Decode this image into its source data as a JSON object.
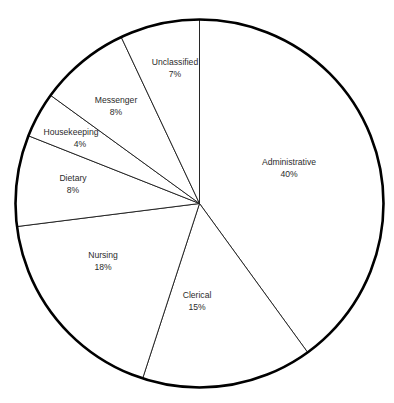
{
  "chart_data": {
    "type": "pie",
    "title": "",
    "subtitle": "",
    "xlabel": "",
    "ylabel": "",
    "legend": "none",
    "grid": false,
    "start_angle_deg_from_12oclock": 0,
    "direction": "clockwise",
    "total_percent": 100,
    "categories": [
      "Administrative",
      "Clerical",
      "Nursing",
      "Dietary",
      "Housekeeping",
      "Messenger",
      "Unclassified"
    ],
    "values": [
      40,
      15,
      18,
      8,
      4,
      8,
      7
    ],
    "value_suffix": "%",
    "slices": [
      {
        "label": "Administrative",
        "value": 40,
        "value_text": "40%",
        "start_deg": 0,
        "end_deg": 144,
        "label_x": 289,
        "label_y": 163,
        "value_x": 289,
        "value_y": 175
      },
      {
        "label": "Clerical",
        "value": 15,
        "value_text": "15%",
        "start_deg": 144,
        "end_deg": 198,
        "label_x": 197,
        "label_y": 296,
        "value_x": 197,
        "value_y": 308
      },
      {
        "label": "Nursing",
        "value": 18,
        "value_text": "18%",
        "start_deg": 198,
        "end_deg": 262.8,
        "label_x": 103,
        "label_y": 256,
        "value_x": 103,
        "value_y": 268
      },
      {
        "label": "Dietary",
        "value": 8,
        "value_text": "8%",
        "start_deg": 262.8,
        "end_deg": 291.6,
        "label_x": 73,
        "label_y": 179,
        "value_x": 73,
        "value_y": 191
      },
      {
        "label": "Housekeeping",
        "value": 4,
        "value_text": "4%",
        "start_deg": 291.6,
        "end_deg": 306,
        "label_x": 71,
        "label_y": 133,
        "value_x": 80,
        "value_y": 145
      },
      {
        "label": "Messenger",
        "value": 8,
        "value_text": "8%",
        "start_deg": 306,
        "end_deg": 334.8,
        "label_x": 116,
        "label_y": 101,
        "value_x": 116,
        "value_y": 113
      },
      {
        "label": "Unclassified",
        "value": 7,
        "value_text": "7%",
        "start_deg": 334.8,
        "end_deg": 360,
        "label_x": 175,
        "label_y": 63,
        "value_x": 175,
        "value_y": 75
      }
    ],
    "geometry": {
      "center_x": 199.5,
      "center_y": 203.5,
      "radius": 184
    },
    "colors": {
      "slice_fill": "#ffffff",
      "divider_stroke": "#1a1a1a",
      "outline_stroke": "#000000",
      "label_text": "#2b2b2b",
      "background": "#ffffff"
    }
  }
}
